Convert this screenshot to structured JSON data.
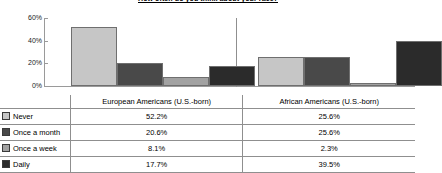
{
  "chart_data": {
    "type": "bar",
    "title": "How often do you think about your race?",
    "xlabel": "",
    "ylabel": "",
    "ylim": [
      0,
      60
    ],
    "ytick_labels": [
      "60%",
      "40%",
      "20%",
      "0%"
    ],
    "ytick_values": [
      60,
      40,
      20,
      0
    ],
    "grid": false,
    "legend_position": "table-below",
    "categories": [
      "European Americans (U.S.-born)",
      "African Americans (U.S.-born)"
    ],
    "series": [
      {
        "name": "Never",
        "values": [
          52.2,
          25.6
        ],
        "labels": [
          "52.2%",
          "25.6%"
        ],
        "color": "#c6c6c6"
      },
      {
        "name": "Once a month",
        "values": [
          20.6,
          25.6
        ],
        "labels": [
          "20.6%",
          "25.6%"
        ],
        "color": "#494949"
      },
      {
        "name": "Once a week",
        "values": [
          8.1,
          2.3
        ],
        "labels": [
          "8.1%",
          "2.3%"
        ],
        "color": "#a2a2a2"
      },
      {
        "name": "Daily",
        "values": [
          17.7,
          39.5
        ],
        "labels": [
          "17.7%",
          "39.5%"
        ],
        "color": "#2b2b2b"
      }
    ]
  },
  "table": {
    "header": [
      "",
      "European Americans (U.S.-born)",
      "African Americans (U.S.-born)"
    ],
    "rows": [
      {
        "label": "Never",
        "eu": "52.2%",
        "af": "25.6%"
      },
      {
        "label": "Once a month",
        "eu": "20.6%",
        "af": "25.6%"
      },
      {
        "label": "Once a week",
        "eu": "8.1%",
        "af": "2.3%"
      },
      {
        "label": "Daily",
        "eu": "17.7%",
        "af": "39.5%"
      }
    ]
  }
}
